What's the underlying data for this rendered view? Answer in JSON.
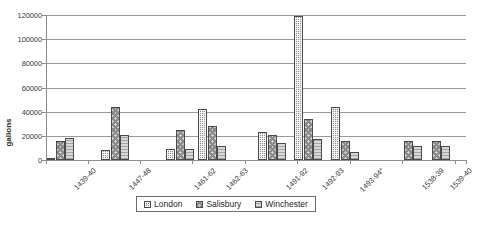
{
  "chart_data": {
    "type": "bar",
    "title": "",
    "xlabel": "",
    "ylabel": "gallons",
    "ylim": [
      0,
      120000
    ],
    "ytick_step": 20000,
    "yticks": [
      "0",
      "20000",
      "40000",
      "60000",
      "80000",
      "100000",
      "120000"
    ],
    "grid": true,
    "legend_position": "bottom",
    "categories": [
      "1439-40",
      "1447-48",
      "1461-62",
      "1462-63",
      "1491-92",
      "1492-93",
      "1493-94*",
      "1538-39",
      "1539-40"
    ],
    "series": [
      {
        "name": "London",
        "values": [
          2000,
          8000,
          9000,
          42000,
          23000,
          119000,
          43500,
          null,
          null
        ]
      },
      {
        "name": "Salisbury",
        "values": [
          15500,
          43500,
          25000,
          28000,
          21000,
          34000,
          16000,
          16000,
          16000
        ]
      },
      {
        "name": "Winchester",
        "values": [
          18500,
          21000,
          9000,
          12000,
          14000,
          17000,
          7000,
          11500,
          11500
        ]
      }
    ],
    "colors": {
      "london": "#8f8f8f",
      "salisbury": "#cfcfcf",
      "winchester": "#d8d8d8",
      "gridline": "#9a9a9a",
      "axis": "#8c8c8c",
      "text": "#3b3b3b"
    }
  },
  "legend": {
    "items": [
      {
        "label": "London"
      },
      {
        "label": "Salisbury"
      },
      {
        "label": "Winchester"
      }
    ]
  },
  "caption": ""
}
